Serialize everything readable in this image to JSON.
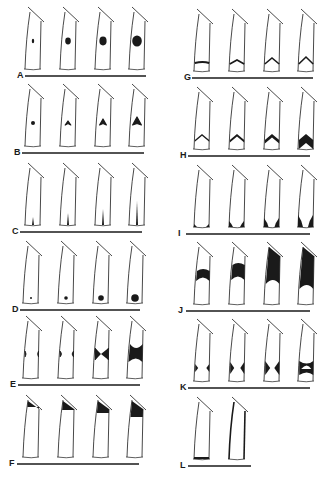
{
  "figure": {
    "ink_color": "#1a1a1a",
    "background": "#ffffff",
    "panels": [
      {
        "label": "A",
        "column": "left",
        "baseline_y": 76,
        "line": [
          25,
          146
        ],
        "pattern": "central-dot-growing",
        "cells": 4,
        "stages": [
          1,
          2,
          3,
          4
        ]
      },
      {
        "label": "B",
        "column": "left",
        "baseline_y": 153,
        "line": [
          22,
          144
        ],
        "pattern": "central-arrowhead-growing",
        "cells": 4,
        "stages": [
          1,
          2,
          3,
          4
        ]
      },
      {
        "label": "C",
        "column": "left",
        "baseline_y": 232,
        "line": [
          20,
          142
        ],
        "pattern": "basal-spike-growing",
        "cells": 4,
        "stages": [
          1,
          2,
          3,
          4
        ]
      },
      {
        "label": "D",
        "column": "left",
        "baseline_y": 310,
        "line": [
          20,
          140
        ],
        "pattern": "basal-dot-growing",
        "cells": 4,
        "stages": [
          1,
          2,
          3,
          4
        ]
      },
      {
        "label": "E",
        "column": "left",
        "baseline_y": 385,
        "line": [
          18,
          140
        ],
        "pattern": "midlateral-hourglass",
        "cells": 4,
        "stages": [
          1,
          2,
          3,
          4
        ]
      },
      {
        "label": "F",
        "column": "left",
        "baseline_y": 464,
        "line": [
          17,
          139
        ],
        "pattern": "apical-cap-growing",
        "cells": 4,
        "stages": [
          1,
          2,
          3,
          4
        ]
      },
      {
        "label": "G",
        "column": "right",
        "baseline_y": 78,
        "line": [
          192,
          313
        ],
        "pattern": "basal-chevron-bar",
        "cells": 4,
        "stages": [
          1,
          2,
          3,
          4
        ]
      },
      {
        "label": "H",
        "column": "right",
        "baseline_y": 156,
        "line": [
          188,
          310
        ],
        "pattern": "basal-chevron-thickening",
        "cells": 4,
        "stages": [
          1,
          2,
          3,
          4
        ]
      },
      {
        "label": "I",
        "column": "right",
        "baseline_y": 234,
        "line": [
          186,
          310
        ],
        "pattern": "basal-corner-fill",
        "cells": 4,
        "stages": [
          1,
          2,
          3,
          4
        ]
      },
      {
        "label": "J",
        "column": "right",
        "baseline_y": 311,
        "line": [
          186,
          310
        ],
        "pattern": "apical-dome-growing",
        "cells": 4,
        "stages": [
          1,
          2,
          3,
          4
        ]
      },
      {
        "label": "K",
        "column": "right",
        "baseline_y": 388,
        "line": [
          188,
          310
        ],
        "pattern": "basal-hourglass-growing",
        "cells": 4,
        "stages": [
          1,
          2,
          3,
          4
        ]
      },
      {
        "label": "L",
        "column": "right",
        "baseline_y": 466,
        "line": [
          188,
          251
        ],
        "pattern": "basal-bar-and-thick-walls",
        "cells": 2,
        "stages": [
          1,
          2
        ]
      }
    ]
  }
}
